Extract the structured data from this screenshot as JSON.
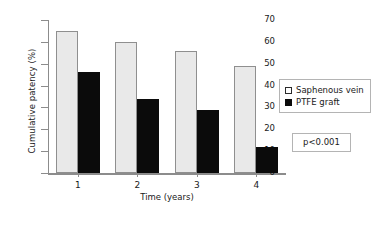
{
  "chart_data": {
    "type": "bar",
    "title": "",
    "xlabel": "Time (years)",
    "ylabel": "Cumulative patency (%)",
    "categories": [
      "1",
      "2",
      "3",
      "4"
    ],
    "ylim": [
      0,
      70
    ],
    "yticks": [
      0,
      10,
      20,
      30,
      40,
      50,
      60,
      70
    ],
    "grid": false,
    "legend_position": "right",
    "series": [
      {
        "name": "Saphenous vein",
        "color": "#e9e9e9",
        "values": [
          65,
          60,
          56,
          49
        ]
      },
      {
        "name": "PTFE graft",
        "color": "#0b0b0b",
        "values": [
          46,
          34,
          29,
          12
        ]
      }
    ],
    "annotations": [
      {
        "name": "p-value",
        "text": "p<0.001"
      }
    ]
  }
}
